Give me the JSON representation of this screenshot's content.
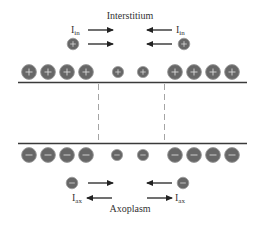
{
  "diagram": {
    "top_region_label": "Interstitium",
    "bottom_region_label": "Axoplasm",
    "current_in": {
      "symbol": "I",
      "subscript": "in"
    },
    "current_ax": {
      "symbol": "I",
      "subscript": "ax"
    },
    "positive_charge_sign": "+",
    "negative_charge_sign": "−",
    "colors": {
      "ion_fill": "#676767",
      "ion_stroke": "#9a9a9a",
      "ion_sign": "#d8d8d8",
      "membrane": "#3a3a3a",
      "dashed": "#9a9a9a",
      "arrow": "#222222",
      "text": "#333333"
    },
    "membrane_top_charges": "positive",
    "membrane_bottom_charges": "negative"
  }
}
